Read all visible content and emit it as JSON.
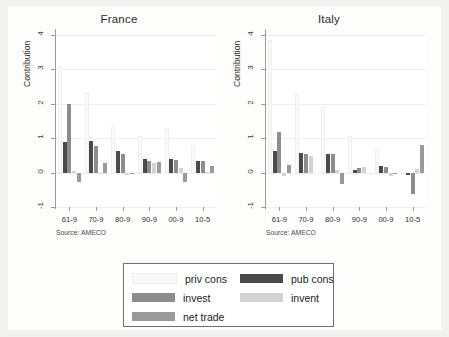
{
  "figure": {
    "background": "#f2f2f0",
    "plot_background": "#ffffff"
  },
  "chart_data": {
    "type": "bar",
    "title": "",
    "subtitle": "",
    "panels": [
      {
        "name": "France",
        "title": "France",
        "ylabel": "Contribution",
        "xlabel": "",
        "source_note": "Source: AMECO",
        "categories": [
          "61-9",
          "70-9",
          "80-9",
          "90-9",
          "00-9",
          "10-5"
        ],
        "ylim": [
          -1,
          4
        ],
        "yticks": [
          4,
          3,
          2,
          1,
          0,
          -1
        ],
        "ytick_labels": [
          "4",
          "3",
          "2",
          "1",
          "0",
          "-1"
        ],
        "grid": true,
        "series": [
          {
            "name": "priv cons",
            "color": "#fafafa",
            "values": [
              3.1,
              2.35,
              1.32,
              1.05,
              1.3,
              0.77
            ]
          },
          {
            "name": "pub cons",
            "color": "#4a4a4a",
            "values": [
              0.88,
              0.92,
              0.63,
              0.39,
              0.4,
              0.33
            ]
          },
          {
            "name": "invest",
            "color": "#8d8d8d",
            "values": [
              1.99,
              0.77,
              0.55,
              0.34,
              0.37,
              0.34
            ]
          },
          {
            "name": "invent",
            "color": "#d2d2d2",
            "values": [
              0.04,
              -0.03,
              -0.06,
              0.27,
              0.13,
              0.03
            ]
          },
          {
            "name": "net trade",
            "color": "#9a9a9a",
            "values": [
              -0.26,
              0.29,
              -0.05,
              0.31,
              -0.26,
              0.18
            ]
          }
        ]
      },
      {
        "name": "Italy",
        "title": "Italy",
        "ylabel": "Contribution",
        "xlabel": "",
        "source_note": "Source: AMECO",
        "categories": [
          "61-9",
          "70-9",
          "80-9",
          "90-9",
          "00-9",
          "10-5"
        ],
        "ylim": [
          -1,
          4
        ],
        "yticks": [
          4,
          3,
          2,
          1,
          0,
          -1
        ],
        "ytick_labels": [
          "4",
          "3",
          "2",
          "1",
          "0",
          "-1"
        ],
        "grid": true,
        "series": [
          {
            "name": "priv cons",
            "color": "#fafafa",
            "values": [
              3.85,
              2.28,
              1.92,
              1.05,
              0.7,
              0.02
            ]
          },
          {
            "name": "pub cons",
            "color": "#4a4a4a",
            "values": [
              0.64,
              0.58,
              0.53,
              0.09,
              0.18,
              -0.07
            ]
          },
          {
            "name": "invest",
            "color": "#8d8d8d",
            "values": [
              1.19,
              0.54,
              0.53,
              0.12,
              0.16,
              -0.62
            ]
          },
          {
            "name": "invent",
            "color": "#d2d2d2",
            "values": [
              -0.09,
              0.47,
              0.09,
              0.15,
              -0.09,
              0.11
            ]
          },
          {
            "name": "net trade",
            "color": "#9a9a9a",
            "values": [
              0.21,
              0.0,
              -0.33,
              0.0,
              -0.03,
              0.79
            ]
          }
        ]
      }
    ],
    "legend": {
      "position": "bottom",
      "entries": [
        {
          "label": "priv cons",
          "color": "#fafafa"
        },
        {
          "label": "invest",
          "color": "#8d8d8d"
        },
        {
          "label": "net trade",
          "color": "#9a9a9a"
        },
        {
          "label": "pub cons",
          "color": "#4a4a4a"
        },
        {
          "label": "invent",
          "color": "#d2d2d2"
        }
      ]
    }
  }
}
